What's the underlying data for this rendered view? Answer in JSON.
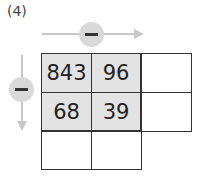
{
  "problem_label": "(4)",
  "operation_horizontal": {
    "symbol": "minus",
    "icon": "minus-icon"
  },
  "operation_vertical": {
    "symbol": "minus",
    "icon": "minus-icon"
  },
  "grid": {
    "rows": [
      [
        "843",
        "96",
        ""
      ],
      [
        "68",
        "39",
        ""
      ],
      [
        "",
        ""
      ]
    ]
  }
}
